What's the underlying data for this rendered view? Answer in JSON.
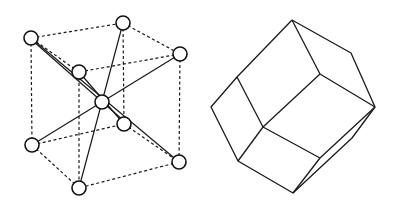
{
  "figures": [
    {
      "id": "bcc-unit-cell",
      "description": "Body-centered cubic lattice unit cell with corner atoms and central atom",
      "atoms": [
        {
          "name": "corner-top-left-back",
          "x": 31,
          "y": 38
        },
        {
          "name": "corner-top-back",
          "x": 123,
          "y": 23
        },
        {
          "name": "corner-top-right",
          "x": 180,
          "y": 54
        },
        {
          "name": "corner-top-front",
          "x": 79,
          "y": 72
        },
        {
          "name": "body-center",
          "x": 102,
          "y": 102
        },
        {
          "name": "corner-bottom-back",
          "x": 124,
          "y": 124
        },
        {
          "name": "corner-bottom-left",
          "x": 32,
          "y": 145
        },
        {
          "name": "corner-bottom-right",
          "x": 179,
          "y": 162
        },
        {
          "name": "corner-bottom-front",
          "x": 79,
          "y": 188
        }
      ],
      "atom_radius": 7
    },
    {
      "id": "rhombic-dodecahedron",
      "description": "Wireframe polyhedron (Wigner-Seitz cell of BCC / rhombic dodecahedron view)",
      "vertices": {
        "top": [
          292,
          20
        ],
        "upper_right": [
          351,
          53
        ],
        "right": [
          375,
          107
        ],
        "inner_top": [
          320,
          74
        ],
        "upper_left": [
          237,
          77
        ],
        "left": [
          211,
          107
        ],
        "center": [
          263,
          127
        ],
        "lower_left": [
          238,
          161
        ],
        "inner_lower_right": [
          320,
          158
        ],
        "bottom": [
          293,
          193
        ],
        "back_lower_right": [
          352,
          138
        ]
      }
    }
  ],
  "colors": {
    "line": "#1a1a1a",
    "background": "#ffffff"
  }
}
